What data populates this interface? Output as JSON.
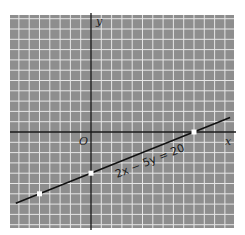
{
  "chart_data": {
    "type": "line",
    "title": "",
    "xlabel": "x",
    "ylabel": "y",
    "origin_label": "O",
    "equation_label": "2x − 5y = 20",
    "equation": {
      "a": 2,
      "b": -5,
      "c": 20
    },
    "grid": true,
    "grid_unit": 1,
    "xlim": [
      -7.9,
      13.9
    ],
    "ylim": [
      -9.3,
      11.4
    ],
    "line_segment": {
      "x_start": -7.3,
      "x_end": 13.5
    },
    "series": [
      {
        "name": "2x − 5y = 20",
        "x": [
          -7.3,
          13.5
        ],
        "y": [
          -6.92,
          1.4
        ]
      }
    ],
    "highlighted_points": [
      {
        "x": -5,
        "y": -6
      },
      {
        "x": 0,
        "y": -4
      },
      {
        "x": 10,
        "y": 0
      }
    ],
    "colors": {
      "grid_background": "#8e8e8e",
      "grid_lines": "#e6e6e6",
      "axes": "#1a1a1a",
      "line": "#111111",
      "points": "#ffffff"
    }
  }
}
